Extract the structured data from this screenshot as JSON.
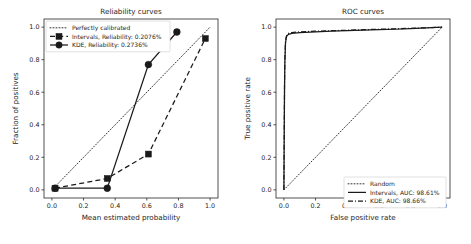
{
  "figure": {
    "width": 471,
    "height": 244,
    "background": "#ffffff",
    "foreground": "#262626"
  },
  "chart_data": [
    {
      "type": "line",
      "id": "reliability",
      "title": "Reliability curves",
      "xlabel": "Mean estimated probability",
      "ylabel": "Fraction of positives",
      "xlim": [
        -0.05,
        1.05
      ],
      "ylim": [
        -0.05,
        1.05
      ],
      "xticks": [
        "0.0",
        "0.2",
        "0.4",
        "0.6",
        "0.8",
        "1.0"
      ],
      "xtickvals": [
        0.0,
        0.2,
        0.4,
        0.6,
        0.8,
        1.0
      ],
      "yticks": [
        "0.0",
        "0.2",
        "0.4",
        "0.6",
        "0.8",
        "1.0"
      ],
      "ytickvals": [
        0.0,
        0.2,
        0.4,
        0.6,
        0.8,
        1.0
      ],
      "grid": false,
      "legend_position": "upper left",
      "series": [
        {
          "name": "Perfectly calibrated",
          "style": "dotted",
          "marker": "none",
          "color": "#1a1a1a",
          "x": [
            0.0,
            1.0
          ],
          "y": [
            0.0,
            1.0
          ]
        },
        {
          "name": "Intervals, Reliability: 0.2076%",
          "style": "dashed",
          "marker": "square",
          "color": "#1a1a1a",
          "x": [
            0.02,
            0.35,
            0.61,
            0.97
          ],
          "y": [
            0.01,
            0.07,
            0.22,
            0.93
          ]
        },
        {
          "name": "KDE, Reliability: 0.2736%",
          "style": "solid",
          "marker": "circle",
          "color": "#1a1a1a",
          "x": [
            0.02,
            0.35,
            0.61,
            0.79
          ],
          "y": [
            0.01,
            0.01,
            0.77,
            0.97
          ]
        }
      ]
    },
    {
      "type": "line",
      "id": "roc",
      "title": "ROC curves",
      "xlabel": "False positive rate",
      "ylabel": "True positive rate",
      "xlim": [
        -0.05,
        1.05
      ],
      "ylim": [
        -0.05,
        1.05
      ],
      "xticks": [
        "0.0",
        "0.2",
        "0.4",
        "0.6",
        "0.8",
        "1.0"
      ],
      "xtickvals": [
        0.0,
        0.2,
        0.4,
        0.6,
        0.8,
        1.0
      ],
      "yticks": [
        "0.0",
        "0.2",
        "0.4",
        "0.6",
        "0.8",
        "1.0"
      ],
      "ytickvals": [
        0.0,
        0.2,
        0.4,
        0.6,
        0.8,
        1.0
      ],
      "grid": false,
      "legend_position": "lower right",
      "series": [
        {
          "name": "Random",
          "style": "dotted",
          "marker": "none",
          "color": "#1a1a1a",
          "x": [
            0.0,
            1.0
          ],
          "y": [
            0.0,
            1.0
          ]
        },
        {
          "name": "Intervals, AUC: 98.61%",
          "style": "solid",
          "marker": "none",
          "color": "#1a1a1a",
          "x": [
            0.0,
            0.002,
            0.004,
            0.006,
            0.01,
            0.015,
            0.02,
            0.03,
            0.05,
            0.1,
            0.2,
            0.3,
            0.4,
            0.5,
            0.6,
            0.7,
            0.8,
            0.9,
            1.0
          ],
          "y": [
            0.0,
            0.35,
            0.62,
            0.78,
            0.9,
            0.935,
            0.948,
            0.956,
            0.961,
            0.966,
            0.971,
            0.975,
            0.978,
            0.981,
            0.984,
            0.987,
            0.991,
            0.995,
            1.0
          ]
        },
        {
          "name": "KDE, AUC: 98.66%",
          "style": "dashdot",
          "marker": "none",
          "color": "#1a1a1a",
          "x": [
            0.0,
            0.002,
            0.004,
            0.006,
            0.01,
            0.015,
            0.02,
            0.03,
            0.05,
            0.1,
            0.2,
            0.3,
            0.4,
            0.5,
            0.6,
            0.7,
            0.8,
            0.9,
            1.0
          ],
          "y": [
            0.0,
            0.38,
            0.66,
            0.8,
            0.915,
            0.942,
            0.954,
            0.962,
            0.967,
            0.971,
            0.975,
            0.978,
            0.981,
            0.984,
            0.987,
            0.99,
            0.993,
            0.996,
            1.0
          ]
        }
      ]
    }
  ]
}
